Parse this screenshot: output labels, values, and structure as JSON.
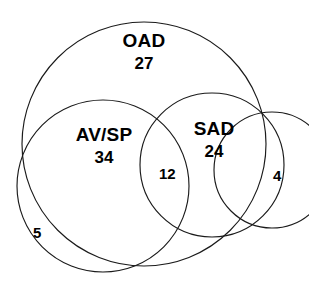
{
  "chart_data": {
    "type": "venn",
    "title": "",
    "background_color": "#ffffff",
    "stroke_color": "#1a1a1a",
    "text_color": "#000000",
    "sets": [
      {
        "name": "oad",
        "label": "OAD",
        "count": "27",
        "center_x": 144,
        "center_y": 144,
        "radius": 122
      },
      {
        "name": "avsp",
        "label": "AV/SP",
        "count": "34",
        "center_x": 103,
        "center_y": 186,
        "radius": 86
      },
      {
        "name": "sad",
        "label": "SAD",
        "count": "24",
        "center_x": 212,
        "center_y": 165,
        "radius": 72
      },
      {
        "name": "outer",
        "label": "",
        "count": "4",
        "center_x": 272,
        "center_y": 170,
        "radius": 58
      }
    ],
    "region_counts": [
      {
        "name": "avsp-sad-intersection",
        "value": "12"
      },
      {
        "name": "outer-right-crescent",
        "value": "4"
      },
      {
        "name": "avsp-outside-oad",
        "value": "5"
      }
    ],
    "values": [
      27,
      34,
      24,
      12,
      4,
      5
    ],
    "categories": [
      "OAD",
      "AV/SP",
      "SAD",
      "AV/SP ∩ SAD",
      "outer",
      "AV/SP outside OAD"
    ]
  },
  "diagram": {
    "oad": {
      "label": "OAD",
      "count": "27"
    },
    "avsp": {
      "label": "AV/SP",
      "count": "34"
    },
    "sad": {
      "label": "SAD",
      "count": "24"
    },
    "intersection": {
      "count": "12"
    },
    "right_crescent": {
      "count": "4"
    },
    "lower_left_crescent": {
      "count": "5"
    }
  }
}
